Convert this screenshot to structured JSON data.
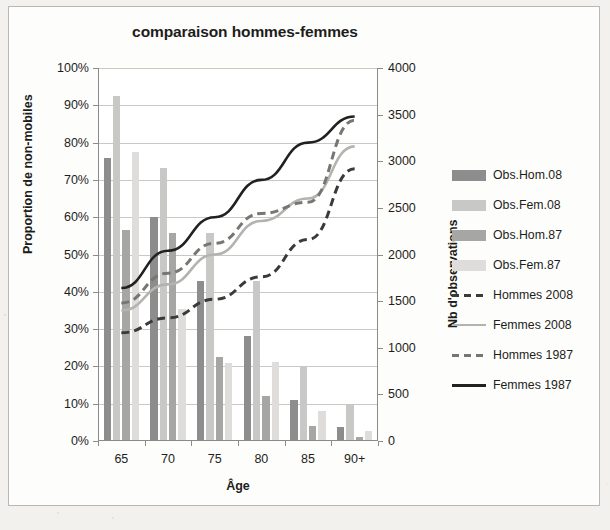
{
  "chart_data": {
    "type": "bar",
    "title": "comparaison hommes-femmes",
    "xlabel": "Âge",
    "ylabel": "Proportion de non-mobiles",
    "y2label": "Nb d'observations",
    "categories": [
      "65",
      "70",
      "75",
      "80",
      "85",
      "90+"
    ],
    "ylim": [
      0,
      100
    ],
    "y2lim": [
      0,
      4000
    ],
    "ytick_labels": [
      "0%",
      "10%",
      "20%",
      "30%",
      "40%",
      "50%",
      "60%",
      "70%",
      "80%",
      "90%",
      "100%"
    ],
    "ytick_values": [
      0,
      10,
      20,
      30,
      40,
      50,
      60,
      70,
      80,
      90,
      100
    ],
    "y2tick_labels": [
      "0",
      "500",
      "1000",
      "1500",
      "2000",
      "2500",
      "3000",
      "3500",
      "4000"
    ],
    "y2tick_values": [
      0,
      500,
      1000,
      1500,
      2000,
      2500,
      3000,
      3500,
      4000
    ],
    "grid": true,
    "legend_position": "right",
    "bar_series": [
      {
        "name": "Obs.Hom.08",
        "axis": "right",
        "color": "#8d8d8d",
        "values": [
          3030,
          2400,
          1720,
          1130,
          445,
          150
        ]
      },
      {
        "name": "Obs.Fem.08",
        "axis": "right",
        "color": "#c8c8c6",
        "values": [
          3700,
          2930,
          2230,
          1720,
          800,
          390
        ]
      },
      {
        "name": "Obs.Hom.87",
        "axis": "right",
        "color": "#a6a6a4",
        "values": [
          2260,
          2230,
          900,
          480,
          160,
          45
        ]
      },
      {
        "name": "Obs.Fem.87",
        "axis": "right",
        "color": "#dedddb",
        "values": [
          3100,
          1420,
          840,
          845,
          320,
          105
        ]
      }
    ],
    "line_series": [
      {
        "name": "Hommes 2008",
        "axis": "left",
        "color": "#3a3a38",
        "style": "dashed",
        "values": [
          29,
          33,
          38,
          44,
          54,
          73
        ]
      },
      {
        "name": "Femmes 2008",
        "axis": "left",
        "color": "#b4b3af",
        "style": "solid",
        "values": [
          35,
          42,
          50,
          59,
          65,
          79
        ]
      },
      {
        "name": "Hommes 1987",
        "axis": "left",
        "color": "#777673",
        "style": "dashed",
        "values": [
          37,
          45,
          53,
          61,
          64,
          86
        ]
      },
      {
        "name": "Femmes 1987",
        "axis": "left",
        "color": "#22211f",
        "style": "solid",
        "values": [
          41,
          51,
          60,
          70,
          80,
          87
        ]
      }
    ]
  },
  "legend": {
    "items": [
      {
        "label": "Obs.Hom.08",
        "kind": "swatch",
        "color": "#8d8d8d"
      },
      {
        "label": "Obs.Fem.08",
        "kind": "swatch",
        "color": "#c8c8c6"
      },
      {
        "label": "Obs.Hom.87",
        "kind": "swatch",
        "color": "#a6a6a4"
      },
      {
        "label": "Obs.Fem.87",
        "kind": "swatch",
        "color": "#dedddb"
      },
      {
        "label": "Hommes 2008",
        "kind": "dashed",
        "color": "#3a3a38"
      },
      {
        "label": "Femmes 2008",
        "kind": "solid-light",
        "color": "#b4b3af"
      },
      {
        "label": "Hommes 1987",
        "kind": "dashed",
        "color": "#777673"
      },
      {
        "label": "Femmes 1987",
        "kind": "solid",
        "color": "#22211f"
      }
    ]
  }
}
